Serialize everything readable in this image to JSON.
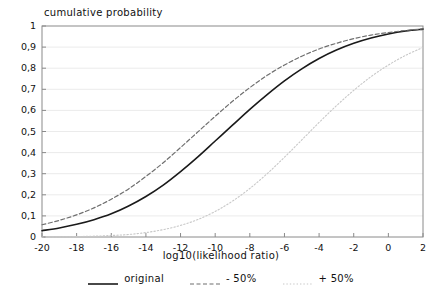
{
  "chart_data": {
    "type": "line",
    "title": "",
    "xlabel": "log10(likelihood ratio)",
    "ylabel": "cumulative probability",
    "xlim": [
      -20,
      2
    ],
    "ylim": [
      0,
      1
    ],
    "grid": "horizontal",
    "legend_position": "bottom-center",
    "xticks": [
      -20,
      -18,
      -16,
      -14,
      -12,
      -10,
      -8,
      -6,
      -4,
      -2,
      0,
      2
    ],
    "xtick_labels": [
      "-20",
      "-18",
      "-16",
      "-14",
      "-12",
      "-10",
      "-8",
      "-6",
      "-4",
      "-2",
      "0",
      "2"
    ],
    "yticks": [
      0,
      0.1,
      0.2,
      0.3,
      0.4,
      0.5,
      0.6,
      0.7,
      0.8,
      0.9,
      1
    ],
    "ytick_labels": [
      "0",
      "0,1",
      "0,2",
      "0,3",
      "0,4",
      "0,5",
      "0,6",
      "0,7",
      "0,8",
      "0,9",
      "1"
    ],
    "x": [
      -20,
      -19,
      -18,
      -17,
      -16,
      -15,
      -14,
      -13,
      -12,
      -11,
      -10,
      -9,
      -8,
      -7,
      -6,
      -5,
      -4,
      -3,
      -2,
      -1,
      0,
      1,
      2
    ],
    "series": [
      {
        "name": "original",
        "style": "solid",
        "color": "#1a1a1a",
        "width": 1.6,
        "values": [
          0.03,
          0.043,
          0.06,
          0.082,
          0.11,
          0.147,
          0.192,
          0.246,
          0.31,
          0.38,
          0.455,
          0.53,
          0.605,
          0.675,
          0.74,
          0.797,
          0.846,
          0.886,
          0.918,
          0.943,
          0.962,
          0.976,
          0.985
        ]
      },
      {
        "name": "- 50%",
        "style": "dashed",
        "color": "#6f6f6f",
        "width": 1.2,
        "values": [
          0.058,
          0.079,
          0.105,
          0.138,
          0.179,
          0.228,
          0.287,
          0.352,
          0.424,
          0.498,
          0.572,
          0.643,
          0.708,
          0.766,
          0.815,
          0.857,
          0.891,
          0.918,
          0.94,
          0.957,
          0.969,
          0.979,
          0.986
        ]
      },
      {
        "name": "+ 50%",
        "style": "dotted",
        "color": "#c8c8c8",
        "width": 1.1,
        "values": [
          0.0,
          0.001,
          0.002,
          0.004,
          0.007,
          0.012,
          0.021,
          0.035,
          0.055,
          0.083,
          0.121,
          0.17,
          0.23,
          0.3,
          0.378,
          0.46,
          0.543,
          0.622,
          0.695,
          0.76,
          0.815,
          0.861,
          0.898
        ]
      }
    ]
  },
  "legend": {
    "items": [
      {
        "label": "original",
        "style": "solid"
      },
      {
        "label": "- 50%",
        "style": "dashed"
      },
      {
        "label": "+ 50%",
        "style": "dotted"
      }
    ]
  },
  "axes": {
    "frame_color": "#8a8a8a",
    "grid_color": "#ebebeb",
    "tick_color": "#8a8a8a"
  }
}
